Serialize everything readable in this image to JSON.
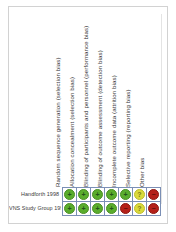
{
  "figure": {
    "kind": "cochrane-risk-of-bias-summary",
    "colors": {
      "low_risk": "#5aad2d",
      "unclear_risk": "#dada3c",
      "high_risk": "#b52019",
      "grid_line": "#7b8fb5",
      "frame": "#d2d2d2",
      "text": "#3a3a3a"
    },
    "glyphs": {
      "low_risk": "+",
      "unclear_risk": "?",
      "high_risk": "−"
    }
  },
  "columns": [
    {
      "label": "Random sequence generation (selection bias)"
    },
    {
      "label": "Allocation concealment (selection bias)"
    },
    {
      "label": "Blinding of participants and personnel (performance bias)"
    },
    {
      "label": "Blinding of outcome assessment (detection bias)"
    },
    {
      "label": "Incomplete outcome data (attrition bias)"
    },
    {
      "label": "Selective reporting (reporting bias)"
    },
    {
      "label": "Other bias"
    }
  ],
  "rows": [
    {
      "label": "Handforth 1998",
      "judgements": [
        "low",
        "low",
        "low",
        "low",
        "low",
        "unclear",
        "high"
      ]
    },
    {
      "label": "VNS Study Group 1995",
      "judgements": [
        "low",
        "low",
        "low",
        "low",
        "high",
        "unclear",
        "high"
      ]
    }
  ]
}
